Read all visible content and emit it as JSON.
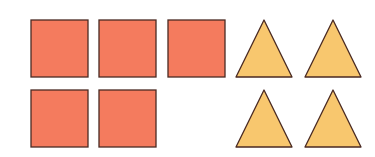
{
  "diagram": {
    "colors": {
      "square_fill": "#F47B5E",
      "triangle_fill": "#F8C76E",
      "stroke": "#4A2A22",
      "background": "#FFFFFF"
    },
    "squares": [
      {
        "x": 31,
        "y": 20,
        "size": 57
      },
      {
        "x": 99,
        "y": 20,
        "size": 57
      },
      {
        "x": 168,
        "y": 20,
        "size": 57
      },
      {
        "x": 31,
        "y": 90,
        "size": 57
      },
      {
        "x": 99,
        "y": 90,
        "size": 57
      }
    ],
    "triangles": [
      {
        "apex_x": 264,
        "top": 20,
        "base_left": 236,
        "base_right": 292,
        "bottom": 77
      },
      {
        "apex_x": 333,
        "top": 20,
        "base_left": 305,
        "base_right": 361,
        "bottom": 77
      },
      {
        "apex_x": 264,
        "top": 90,
        "base_left": 236,
        "base_right": 292,
        "bottom": 147
      },
      {
        "apex_x": 333,
        "top": 90,
        "base_left": 305,
        "base_right": 361,
        "bottom": 147
      }
    ],
    "counts": {
      "squares": 5,
      "triangles": 4
    }
  }
}
